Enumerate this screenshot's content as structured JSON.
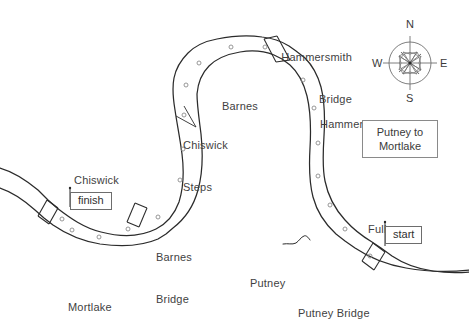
{
  "map": {
    "title_box": {
      "line1": "Putney to",
      "line2": "Mortlake"
    },
    "places": [
      {
        "name": "hammersmith-bridge",
        "label_line1": "Hammersmith",
        "label_line2": "Bridge",
        "x": 268,
        "y": 22,
        "align": "right",
        "width": 84
      },
      {
        "name": "hammersmith",
        "label_line1": "Hammersmith",
        "label_line2": "",
        "x": 320,
        "y": 92,
        "align": "left",
        "width": 84
      },
      {
        "name": "barnes",
        "label_line1": "Barnes",
        "label_line2": "",
        "x": 222,
        "y": 74,
        "align": "left",
        "width": 46
      },
      {
        "name": "chiswick-steps",
        "label_line1": "Chiswick",
        "label_line2": "Steps",
        "x": 183,
        "y": 110,
        "align": "left",
        "width": 56
      },
      {
        "name": "chiswick",
        "label_line1": "Chiswick",
        "label_line2": "",
        "x": 74,
        "y": 148,
        "align": "left",
        "width": 56
      },
      {
        "name": "barnes-bridge",
        "label_line1": "Barnes",
        "label_line2": "Bridge",
        "x": 156,
        "y": 222,
        "align": "left",
        "width": 48
      },
      {
        "name": "mortlake",
        "label_line1": "Mortlake",
        "label_line2": "",
        "x": 68,
        "y": 275,
        "align": "left",
        "width": 58
      },
      {
        "name": "putney",
        "label_line1": "Putney",
        "label_line2": "",
        "x": 250,
        "y": 251,
        "align": "left",
        "width": 46
      },
      {
        "name": "putney-bridge",
        "label_line1": "Putney Bridge",
        "label_line2": "",
        "x": 298,
        "y": 281,
        "align": "left",
        "width": 86
      },
      {
        "name": "fulham",
        "label_line1": "Fulham",
        "label_line2": "",
        "x": 368,
        "y": 197,
        "align": "left",
        "width": 48
      }
    ],
    "course_markers": [
      {
        "label": "start",
        "x": 385,
        "y": 229
      },
      {
        "label": "finish",
        "x": 70,
        "y": 194
      }
    ],
    "compass": {
      "north": "N",
      "east": "E",
      "south": "S",
      "west": "W",
      "center_x": 410,
      "center_y": 63,
      "radius": 21
    },
    "colors": {
      "ink": "#2b2b2b",
      "text": "#3a3a3a",
      "box_border": "#8a8a8a",
      "paper": "#ffffff",
      "marker_stroke": "#8b8b8b"
    },
    "river_markers_count": 18
  }
}
